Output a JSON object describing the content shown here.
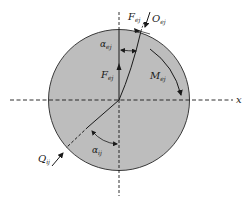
{
  "diagram": {
    "colors": {
      "disk_fill": "#bdbdbd",
      "disk_stroke": "#3a3a3a",
      "line": "#1a1a1a",
      "background": "#ffffff"
    },
    "axis": {
      "x_label": "x"
    },
    "labels": {
      "force_top_main": "F",
      "force_top_sub": "ej",
      "contact_top_main": "O",
      "contact_top_sub": "ej",
      "angle_top_main": "α",
      "angle_top_sub": "ej",
      "force_center_main": "F",
      "force_center_sub": "ej",
      "moment_main": "M",
      "moment_sub": "ej",
      "contact_bottom_main": "Q",
      "contact_bottom_sub": "ij",
      "angle_bottom_main": "α",
      "angle_bottom_sub": "ij"
    }
  }
}
